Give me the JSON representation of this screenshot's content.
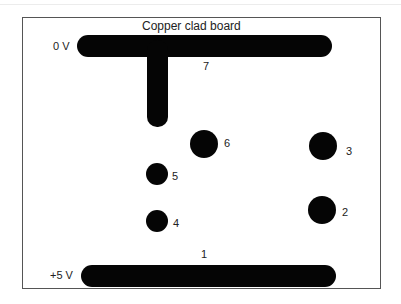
{
  "diagram": {
    "title": "Copper clad board",
    "rails": {
      "top": {
        "label": "0 V",
        "number": "7"
      },
      "bottom": {
        "label": "+5 V",
        "number": "1"
      }
    },
    "pads": [
      {
        "id": "2",
        "label": "2",
        "size": "large"
      },
      {
        "id": "3",
        "label": "3",
        "size": "large"
      },
      {
        "id": "4",
        "label": "4",
        "size": "small"
      },
      {
        "id": "5",
        "label": "5",
        "size": "small"
      },
      {
        "id": "6",
        "label": "6",
        "size": "large"
      }
    ],
    "colors": {
      "copper": "#050505",
      "border": "#555555",
      "background": "#ffffff"
    }
  }
}
